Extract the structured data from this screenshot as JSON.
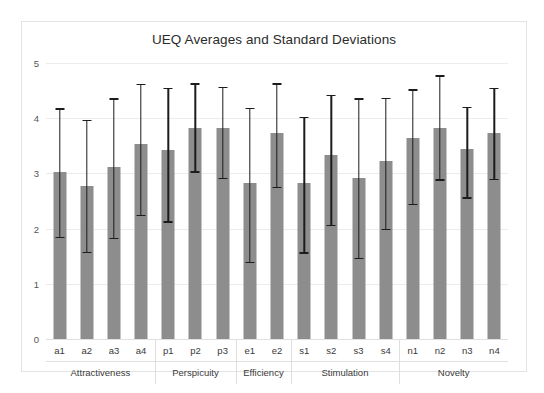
{
  "chart_data": {
    "type": "bar",
    "title": "UEQ Averages and Standard Deviations",
    "xlabel": "",
    "ylabel": "",
    "ylim": [
      0,
      5
    ],
    "yticks": [
      0,
      1,
      2,
      3,
      4,
      5
    ],
    "grid": true,
    "legend": false,
    "error_bars": "standard deviation",
    "categories": [
      "a1",
      "a2",
      "a3",
      "a4",
      "p1",
      "p2",
      "p3",
      "e1",
      "e2",
      "s1",
      "s2",
      "s3",
      "s4",
      "n1",
      "n2",
      "n3",
      "n4"
    ],
    "values": [
      3.03,
      2.78,
      3.12,
      3.54,
      3.43,
      3.83,
      3.82,
      2.82,
      3.73,
      2.82,
      3.34,
      2.92,
      3.22,
      3.64,
      3.83,
      3.45,
      3.74
    ],
    "err_low": [
      1.85,
      1.58,
      1.83,
      2.25,
      2.13,
      3.04,
      2.92,
      1.4,
      2.76,
      1.57,
      2.07,
      1.47,
      2.0,
      2.45,
      2.89,
      2.57,
      2.9
    ],
    "err_high": [
      4.18,
      3.97,
      4.36,
      4.62,
      4.55,
      4.63,
      4.57,
      4.19,
      4.63,
      4.03,
      4.42,
      4.36,
      4.37,
      4.52,
      4.78,
      4.21,
      4.55
    ],
    "groups": [
      {
        "label": "Attractiveness",
        "members": [
          "a1",
          "a2",
          "a3",
          "a4"
        ]
      },
      {
        "label": "Perspicuity",
        "members": [
          "p1",
          "p2",
          "p3"
        ]
      },
      {
        "label": "Efficiency",
        "members": [
          "e1",
          "e2"
        ]
      },
      {
        "label": "Stimulation",
        "members": [
          "s1",
          "s2",
          "s3",
          "s4"
        ]
      },
      {
        "label": "Novelty",
        "members": [
          "n1",
          "n2",
          "n3",
          "n4"
        ]
      }
    ],
    "colors": {
      "bar": "#8d8d8d",
      "error": "#1c1c1c",
      "grid": "#ececec",
      "frame": "#e3e3e3",
      "text": "#2b2b2b",
      "background": "#ffffff"
    }
  }
}
